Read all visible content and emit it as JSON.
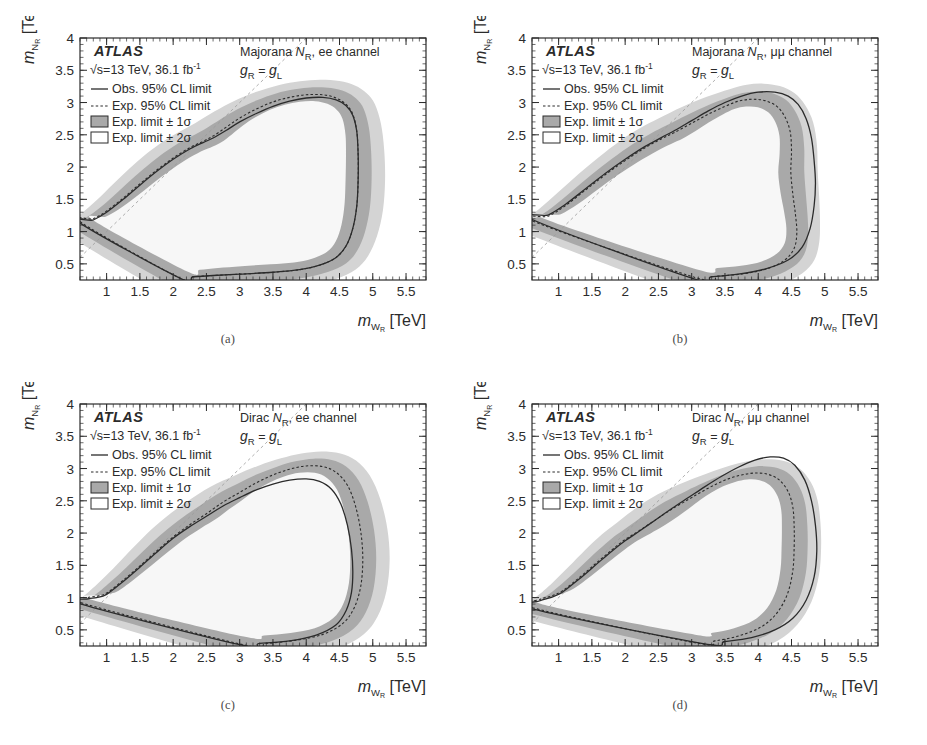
{
  "figure": {
    "axis": {
      "xlabel_main": "m",
      "xlabel_sub": "W",
      "xlabel_sub2": "R",
      "xlabel_unit": "[TeV]",
      "ylabel_main": "m",
      "ylabel_sub": "N",
      "ylabel_sub2": "R",
      "ylabel_unit": "[TeV]",
      "x_ticks": [
        "1",
        "1.5",
        "2",
        "2.5",
        "3",
        "3.5",
        "4",
        "4.5",
        "5",
        "5.5"
      ],
      "y_ticks": [
        "0.5",
        "1",
        "1.5",
        "2",
        "2.5",
        "3",
        "3.5",
        "4"
      ],
      "xlim": [
        0.6,
        5.8
      ],
      "ylim": [
        0.25,
        4.0
      ]
    },
    "legend": {
      "experiment": "ATLAS",
      "lumi_pre": "√s=13 TeV, 36.1 fb",
      "lumi_sup": "-1",
      "obs": "Obs. 95% CL limit",
      "exp": "Exp. 95% CL limit",
      "band1": "Exp. limit ± 1σ",
      "band2": "Exp. limit ± 2σ"
    },
    "coupling": {
      "g": "g",
      "sub_r": "R",
      "eq": " = ",
      "g2": "g",
      "sub_l": "L"
    },
    "colors": {
      "band_1sigma": "#a9a9a9",
      "band_2sigma": "#d4d4d4",
      "observed_line": "#2b2b2b",
      "expected_line": "#2b2b2b",
      "frame": "#2b2b2b",
      "diagonal": "#9b9b9b",
      "background": "#ffffff"
    },
    "panels": [
      {
        "id": "a",
        "caption": "(a)",
        "annotation_pre": "Majorana ",
        "annotation_n": "N",
        "annotation_sub": "R",
        "annotation_post": ", ee channel",
        "channel": "ee",
        "model": "Majorana"
      },
      {
        "id": "b",
        "caption": "(b)",
        "annotation_pre": "Majorana ",
        "annotation_n": "N",
        "annotation_sub": "R",
        "annotation_post": ", μμ channel",
        "channel": "μμ",
        "model": "Majorana"
      },
      {
        "id": "c",
        "caption": "(c)",
        "annotation_pre": "Dirac ",
        "annotation_n": "N",
        "annotation_sub": "R",
        "annotation_post": ", ee channel",
        "channel": "ee",
        "model": "Dirac"
      },
      {
        "id": "d",
        "caption": "(d)",
        "annotation_pre": "Dirac ",
        "annotation_n": "N",
        "annotation_sub": "R",
        "annotation_post": ", μμ channel",
        "channel": "μμ",
        "model": "Dirac"
      }
    ]
  },
  "chart_data": {
    "type": "line",
    "xlabel": "m_WR [TeV]",
    "ylabel": "m_NR [TeV]",
    "xlim": [
      0.6,
      5.8
    ],
    "ylim": [
      0.25,
      4.0
    ],
    "xticks": [
      1,
      1.5,
      2,
      2.5,
      3,
      3.5,
      4,
      4.5,
      5,
      5.5
    ],
    "yticks": [
      0.5,
      1,
      1.5,
      2,
      2.5,
      3,
      3.5,
      4
    ],
    "grid": false,
    "legend_position": "top-left",
    "legend_entries": [
      "Obs. 95% CL limit",
      "Exp. 95% CL limit",
      "Exp. limit ± 1σ",
      "Exp. limit ± 2σ"
    ],
    "panels": [
      {
        "id": "a",
        "label": "Majorana N_R, ee channel",
        "observed_contour": [
          [
            0.62,
            1.12
          ],
          [
            0.8,
            1.18
          ],
          [
            1.0,
            1.3
          ],
          [
            1.25,
            1.5
          ],
          [
            1.5,
            1.72
          ],
          [
            1.75,
            1.93
          ],
          [
            2.0,
            2.12
          ],
          [
            2.25,
            2.28
          ],
          [
            2.45,
            2.38
          ],
          [
            2.6,
            2.45
          ],
          [
            2.8,
            2.57
          ],
          [
            3.0,
            2.7
          ],
          [
            3.25,
            2.83
          ],
          [
            3.5,
            2.94
          ],
          [
            3.75,
            3.02
          ],
          [
            4.0,
            3.07
          ],
          [
            4.25,
            3.08
          ],
          [
            4.45,
            3.04
          ],
          [
            4.6,
            2.95
          ],
          [
            4.7,
            2.8
          ],
          [
            4.76,
            2.55
          ],
          [
            4.78,
            2.2
          ],
          [
            4.78,
            1.8
          ],
          [
            4.76,
            1.4
          ],
          [
            4.7,
            1.05
          ],
          [
            4.6,
            0.78
          ],
          [
            4.45,
            0.6
          ],
          [
            4.2,
            0.48
          ],
          [
            3.9,
            0.41
          ],
          [
            3.5,
            0.37
          ],
          [
            3.0,
            0.34
          ],
          [
            2.6,
            0.32
          ],
          [
            2.3,
            0.3
          ],
          [
            2.1,
            0.28
          ]
        ],
        "expected_contour": [
          [
            0.62,
            1.14
          ],
          [
            0.8,
            1.2
          ],
          [
            1.0,
            1.32
          ],
          [
            1.25,
            1.52
          ],
          [
            1.5,
            1.74
          ],
          [
            1.75,
            1.95
          ],
          [
            2.0,
            2.14
          ],
          [
            2.25,
            2.3
          ],
          [
            2.45,
            2.4
          ],
          [
            2.6,
            2.48
          ],
          [
            2.8,
            2.62
          ],
          [
            3.0,
            2.76
          ],
          [
            3.25,
            2.9
          ],
          [
            3.5,
            3.01
          ],
          [
            3.75,
            3.08
          ],
          [
            4.0,
            3.12
          ],
          [
            4.25,
            3.12
          ],
          [
            4.45,
            3.07
          ],
          [
            4.6,
            2.97
          ],
          [
            4.7,
            2.82
          ],
          [
            4.76,
            2.55
          ],
          [
            4.78,
            2.2
          ],
          [
            4.78,
            1.8
          ],
          [
            4.76,
            1.4
          ],
          [
            4.7,
            1.05
          ],
          [
            4.6,
            0.78
          ],
          [
            4.45,
            0.6
          ],
          [
            4.2,
            0.48
          ],
          [
            3.9,
            0.41
          ],
          [
            3.5,
            0.37
          ],
          [
            3.0,
            0.34
          ],
          [
            2.6,
            0.32
          ],
          [
            2.3,
            0.3
          ],
          [
            2.1,
            0.28
          ]
        ],
        "excluded_wr_max": 4.78,
        "excluded_nr_max": 3.12
      },
      {
        "id": "b",
        "label": "Majorana N_R, μμ channel",
        "observed_contour": [
          [
            0.62,
            1.18
          ],
          [
            0.85,
            1.26
          ],
          [
            1.1,
            1.42
          ],
          [
            1.4,
            1.66
          ],
          [
            1.7,
            1.9
          ],
          [
            2.0,
            2.12
          ],
          [
            2.3,
            2.32
          ],
          [
            2.55,
            2.46
          ],
          [
            2.75,
            2.57
          ],
          [
            3.0,
            2.72
          ],
          [
            3.25,
            2.87
          ],
          [
            3.5,
            3.0
          ],
          [
            3.75,
            3.1
          ],
          [
            4.0,
            3.16
          ],
          [
            4.25,
            3.16
          ],
          [
            4.45,
            3.1
          ],
          [
            4.6,
            2.97
          ],
          [
            4.72,
            2.75
          ],
          [
            4.8,
            2.45
          ],
          [
            4.84,
            2.1
          ],
          [
            4.86,
            1.75
          ],
          [
            4.84,
            1.4
          ],
          [
            4.78,
            1.05
          ],
          [
            4.66,
            0.76
          ],
          [
            4.45,
            0.56
          ],
          [
            4.1,
            0.42
          ],
          [
            3.7,
            0.34
          ],
          [
            3.3,
            0.3
          ],
          [
            3.0,
            0.28
          ]
        ],
        "expected_contour": [
          [
            0.62,
            1.16
          ],
          [
            0.85,
            1.24
          ],
          [
            1.1,
            1.4
          ],
          [
            1.4,
            1.64
          ],
          [
            1.7,
            1.88
          ],
          [
            2.0,
            2.1
          ],
          [
            2.3,
            2.3
          ],
          [
            2.55,
            2.44
          ],
          [
            2.75,
            2.54
          ],
          [
            3.0,
            2.68
          ],
          [
            3.25,
            2.82
          ],
          [
            3.5,
            2.94
          ],
          [
            3.7,
            3.02
          ],
          [
            3.9,
            3.05
          ],
          [
            4.1,
            3.03
          ],
          [
            4.28,
            2.94
          ],
          [
            4.4,
            2.78
          ],
          [
            4.48,
            2.55
          ],
          [
            4.5,
            2.25
          ],
          [
            4.49,
            1.92
          ],
          [
            4.52,
            1.58
          ],
          [
            4.56,
            1.26
          ],
          [
            4.58,
            0.98
          ],
          [
            4.54,
            0.74
          ],
          [
            4.4,
            0.56
          ],
          [
            4.15,
            0.43
          ],
          [
            3.8,
            0.35
          ],
          [
            3.4,
            0.31
          ],
          [
            3.05,
            0.29
          ]
        ],
        "excluded_wr_max": 4.86,
        "excluded_nr_max": 3.16
      },
      {
        "id": "c",
        "label": "Dirac N_R, ee channel",
        "observed_contour": [
          [
            0.62,
            0.9
          ],
          [
            0.72,
            0.98
          ],
          [
            0.85,
            1.0
          ],
          [
            1.0,
            1.05
          ],
          [
            1.25,
            1.25
          ],
          [
            1.5,
            1.47
          ],
          [
            1.75,
            1.7
          ],
          [
            2.0,
            1.92
          ],
          [
            2.25,
            2.1
          ],
          [
            2.5,
            2.26
          ],
          [
            2.75,
            2.42
          ],
          [
            3.0,
            2.55
          ],
          [
            3.25,
            2.67
          ],
          [
            3.5,
            2.76
          ],
          [
            3.75,
            2.82
          ],
          [
            4.0,
            2.84
          ],
          [
            4.2,
            2.8
          ],
          [
            4.38,
            2.68
          ],
          [
            4.52,
            2.45
          ],
          [
            4.62,
            2.12
          ],
          [
            4.68,
            1.75
          ],
          [
            4.7,
            1.4
          ],
          [
            4.68,
            1.08
          ],
          [
            4.6,
            0.8
          ],
          [
            4.45,
            0.58
          ],
          [
            4.15,
            0.42
          ],
          [
            3.75,
            0.33
          ],
          [
            3.3,
            0.29
          ],
          [
            3.0,
            0.27
          ]
        ],
        "expected_contour": [
          [
            0.62,
            0.92
          ],
          [
            0.72,
            1.0
          ],
          [
            0.85,
            1.02
          ],
          [
            1.0,
            1.07
          ],
          [
            1.25,
            1.27
          ],
          [
            1.5,
            1.49
          ],
          [
            1.75,
            1.72
          ],
          [
            2.0,
            1.94
          ],
          [
            2.25,
            2.13
          ],
          [
            2.5,
            2.3
          ],
          [
            2.75,
            2.48
          ],
          [
            3.0,
            2.63
          ],
          [
            3.25,
            2.78
          ],
          [
            3.5,
            2.9
          ],
          [
            3.75,
            2.99
          ],
          [
            4.0,
            3.04
          ],
          [
            4.25,
            3.03
          ],
          [
            4.45,
            2.94
          ],
          [
            4.62,
            2.74
          ],
          [
            4.74,
            2.42
          ],
          [
            4.82,
            2.02
          ],
          [
            4.85,
            1.6
          ],
          [
            4.82,
            1.18
          ],
          [
            4.72,
            0.84
          ],
          [
            4.55,
            0.6
          ],
          [
            4.25,
            0.43
          ],
          [
            3.85,
            0.34
          ],
          [
            3.4,
            0.29
          ],
          [
            3.05,
            0.27
          ]
        ],
        "excluded_wr_max": 4.7,
        "excluded_nr_max": 2.84
      },
      {
        "id": "d",
        "label": "Dirac N_R, μμ channel",
        "observed_contour": [
          [
            0.62,
            0.82
          ],
          [
            0.72,
            0.95
          ],
          [
            0.88,
            1.0
          ],
          [
            1.05,
            1.08
          ],
          [
            1.3,
            1.28
          ],
          [
            1.55,
            1.5
          ],
          [
            1.8,
            1.72
          ],
          [
            2.0,
            1.88
          ],
          [
            2.2,
            2.02
          ],
          [
            2.45,
            2.2
          ],
          [
            2.7,
            2.38
          ],
          [
            2.95,
            2.55
          ],
          [
            3.2,
            2.72
          ],
          [
            3.45,
            2.88
          ],
          [
            3.7,
            3.02
          ],
          [
            3.95,
            3.13
          ],
          [
            4.18,
            3.18
          ],
          [
            4.38,
            3.16
          ],
          [
            4.55,
            3.05
          ],
          [
            4.7,
            2.82
          ],
          [
            4.8,
            2.5
          ],
          [
            4.86,
            2.12
          ],
          [
            4.88,
            1.72
          ],
          [
            4.84,
            1.32
          ],
          [
            4.72,
            0.96
          ],
          [
            4.52,
            0.68
          ],
          [
            4.25,
            0.5
          ],
          [
            3.9,
            0.38
          ],
          [
            3.5,
            0.32
          ],
          [
            3.15,
            0.29
          ]
        ],
        "expected_contour": [
          [
            0.62,
            0.84
          ],
          [
            0.72,
            0.97
          ],
          [
            0.88,
            1.02
          ],
          [
            1.05,
            1.1
          ],
          [
            1.3,
            1.3
          ],
          [
            1.55,
            1.52
          ],
          [
            1.8,
            1.74
          ],
          [
            2.0,
            1.9
          ],
          [
            2.2,
            2.03
          ],
          [
            2.45,
            2.2
          ],
          [
            2.7,
            2.37
          ],
          [
            2.95,
            2.52
          ],
          [
            3.15,
            2.64
          ],
          [
            3.35,
            2.75
          ],
          [
            3.55,
            2.84
          ],
          [
            3.75,
            2.9
          ],
          [
            3.95,
            2.93
          ],
          [
            4.15,
            2.91
          ],
          [
            4.32,
            2.82
          ],
          [
            4.45,
            2.64
          ],
          [
            4.52,
            2.4
          ],
          [
            4.54,
            2.1
          ],
          [
            4.54,
            1.78
          ],
          [
            4.52,
            1.42
          ],
          [
            4.44,
            1.06
          ],
          [
            4.28,
            0.76
          ],
          [
            4.05,
            0.55
          ],
          [
            3.72,
            0.41
          ],
          [
            3.35,
            0.33
          ],
          [
            3.05,
            0.3
          ]
        ],
        "excluded_wr_max": 4.88,
        "excluded_nr_max": 3.18
      }
    ]
  }
}
